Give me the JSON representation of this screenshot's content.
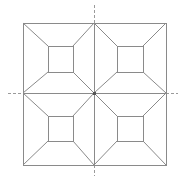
{
  "diagram": {
    "type": "geometric-tiling",
    "colors": {
      "stroke": "#8a8a8a",
      "axis": "#9a9a9a",
      "center": "#555555",
      "background": "#ffffff"
    },
    "outer_square": {
      "x1": 23,
      "y1": 23,
      "x2": 166,
      "y2": 165
    },
    "center": {
      "x": 94,
      "y": 93
    },
    "axes": {
      "vertical": {
        "x": 94,
        "y_start": 5,
        "y_end": 176
      },
      "horizontal": {
        "y": 93,
        "x_start": 8,
        "x_end": 178
      }
    },
    "quadrants": [
      {
        "name": "top-left",
        "outer": [
          23,
          23,
          94,
          93
        ],
        "inner": [
          48,
          46,
          73,
          72
        ]
      },
      {
        "name": "top-right",
        "outer": [
          94,
          23,
          166,
          93
        ],
        "inner": [
          117,
          46,
          143,
          72
        ]
      },
      {
        "name": "bottom-left",
        "outer": [
          23,
          93,
          94,
          165
        ],
        "inner": [
          48,
          116,
          73,
          141
        ]
      },
      {
        "name": "bottom-right",
        "outer": [
          94,
          93,
          166,
          165
        ],
        "inner": [
          117,
          116,
          143,
          141
        ]
      }
    ]
  }
}
